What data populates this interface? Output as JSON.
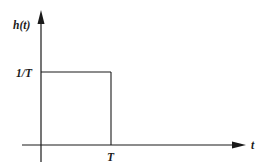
{
  "diagram": {
    "y_axis_label": "h(t)",
    "x_axis_label": "t",
    "level_label": "1/T",
    "time_label": "T",
    "line_color": "#1a1a1a",
    "background": "#ffffff"
  }
}
